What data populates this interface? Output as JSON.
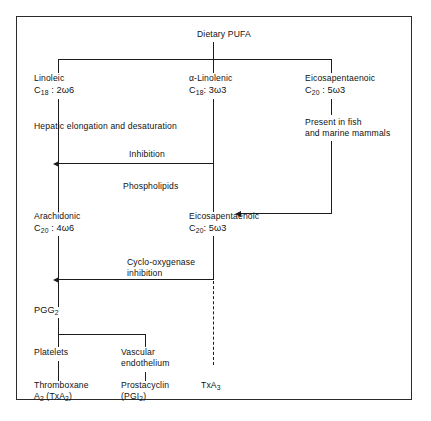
{
  "figure": {
    "border_color": "#2b2b2b",
    "line_color": "#1c1c1c",
    "background": "#ffffff"
  },
  "nodes": {
    "dietary_pufa": "Dietary PUFA",
    "linoleic": {
      "name": "Linoleic",
      "formula_c": "C",
      "formula_carbons": "18",
      "formula_rest": " : 2ω6"
    },
    "alpha_linolenic": {
      "name": "α-Linolenic",
      "formula_c": "C",
      "formula_carbons": "18",
      "formula_rest": ": 3ω3"
    },
    "eicosapentaenoic_top": {
      "name": "Eicosapentaenoic",
      "formula_c": "C",
      "formula_carbons": "20",
      "formula_rest": " : 5ω3"
    },
    "arachidonic": {
      "name": "Arachidonic",
      "formula_c": "C",
      "formula_carbons": "20",
      "formula_rest": " : 4ω6"
    },
    "eicosapentaenoic_mid": {
      "name": "Eicosapentaenoic",
      "formula_c": "C",
      "formula_carbons": "20",
      "formula_rest": ": 5ω3"
    },
    "pgg2": {
      "name": "PGG",
      "sub": "2"
    },
    "platelets": "Platelets",
    "vascular_endothelium_line1": "Vascular",
    "vascular_endothelium_line2": "endothelium",
    "thromboxane_line1": "Thromboxane",
    "thromboxane_line2_a": "A",
    "thromboxane_line2_sub1": "2",
    "thromboxane_line2_b": " (TxA",
    "thromboxane_line2_sub2": "2",
    "thromboxane_line2_c": ")",
    "prostacyclin_line1": "Prostacyclin",
    "prostacyclin_line2_a": "(PGI",
    "prostacyclin_line2_sub": "2",
    "prostacyclin_line2_b": ")",
    "txa3_a": "TxA",
    "txa3_sub": "3"
  },
  "edge_captions": {
    "hepatic": "Hepatic elongation and desaturation",
    "present_in_fish_line1": "Present in fish",
    "present_in_fish_line2": "and marine mammals",
    "inhibition": "Inhibition",
    "phospholipids": "Phospholipids",
    "cyclo_oxygenase_line1": "Cyclo-oxygenase",
    "cyclo_oxygenase_line2": "inhibition"
  }
}
